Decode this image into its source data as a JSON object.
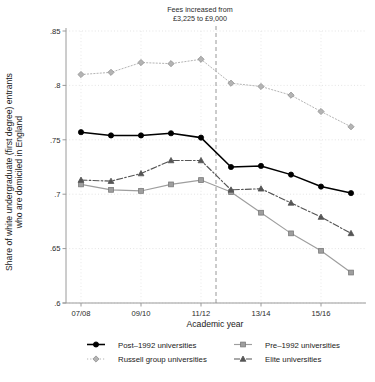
{
  "chart_data": {
    "type": "line",
    "title": "",
    "xlabel": "Academic year",
    "ylabel": "Share of white undergraduate (first degree) entrants\nwho are domiciled in England",
    "ylabel_line1": "Share of white undergraduate (first degree) entrants",
    "ylabel_line2": "who are domiciled in England",
    "x": [
      "07/08",
      "08/09",
      "09/10",
      "10/11",
      "11/12",
      "12/13",
      "13/14",
      "14/15",
      "15/16",
      "16/17"
    ],
    "xtick_labels": [
      "07/08",
      "09/10",
      "11/12",
      "13/14",
      "15/16"
    ],
    "xtick_values": [
      "07/08",
      "09/10",
      "11/12",
      "13/14",
      "15/16"
    ],
    "ytick_labels": [
      ".85",
      ".8",
      ".75",
      ".7",
      ".65",
      ".6"
    ],
    "ytick_values": [
      0.85,
      0.8,
      0.75,
      0.7,
      0.65,
      0.6
    ],
    "ylim": [
      0.6,
      0.85
    ],
    "grid": true,
    "legend_position": "bottom",
    "annotation": {
      "line1": "Fees increased from",
      "line2": "£3,225 to £9,000",
      "vline_at": "11/12-12/13 boundary"
    },
    "series": [
      {
        "name": "Post–1992 universities",
        "color": "#000000",
        "marker": "circle",
        "linestyle": "solid",
        "values": [
          0.757,
          0.754,
          0.754,
          0.756,
          0.752,
          0.725,
          0.726,
          0.718,
          0.707,
          0.701
        ]
      },
      {
        "name": "Pre–1992 universities",
        "color": "#9e9e9e",
        "marker": "square",
        "linestyle": "solid",
        "values": [
          0.709,
          0.704,
          0.703,
          0.709,
          0.713,
          0.702,
          0.683,
          0.664,
          0.648,
          0.628
        ]
      },
      {
        "name": "Russell group universities",
        "color": "#b4b4b4",
        "marker": "diamond",
        "linestyle": "dotted",
        "values": [
          0.81,
          0.812,
          0.821,
          0.82,
          0.824,
          0.802,
          0.799,
          0.791,
          0.776,
          0.762
        ]
      },
      {
        "name": "Elite universities",
        "color": "#555555",
        "marker": "triangle",
        "linestyle": "dashdot",
        "values": [
          0.713,
          0.712,
          0.719,
          0.731,
          0.731,
          0.704,
          0.705,
          0.692,
          0.679,
          0.664
        ]
      }
    ]
  }
}
